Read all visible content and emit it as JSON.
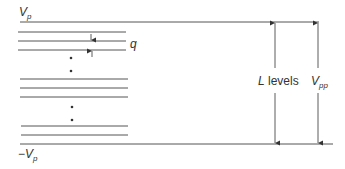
{
  "diagram": {
    "labels": {
      "top_rail": "V",
      "top_rail_sub": "p",
      "bottom_rail_prefix": "−",
      "bottom_rail": "V",
      "bottom_rail_sub": "p",
      "step": "q",
      "levels_var": "L",
      "levels_text": " levels",
      "vpp": "V",
      "vpp_sub": "pp"
    },
    "colors": {
      "line": "#555555",
      "text": "#333333"
    },
    "geometry": {
      "top_rail_y": 22,
      "bottom_rail_y": 144,
      "level_lines_y": [
        32,
        41,
        50,
        79,
        88,
        97,
        126,
        135
      ],
      "ellipsis_dots_y": [
        58,
        71,
        107,
        120
      ]
    }
  }
}
